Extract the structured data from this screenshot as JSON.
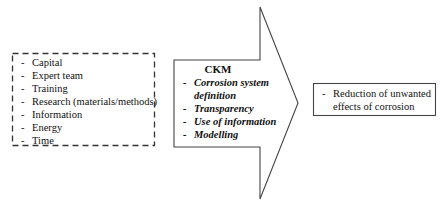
{
  "inputs": {
    "items": [
      "Capital",
      "Expert team",
      "Training",
      "Research (materials/methods)",
      "Information",
      "Energy",
      "Time"
    ]
  },
  "ckm": {
    "title": "CKM",
    "items": [
      {
        "line1": "Corrosion system",
        "line2": "definition"
      },
      {
        "line1": "Transparency",
        "line2": ""
      },
      {
        "line1": "Use of information",
        "line2": ""
      },
      {
        "line1": "Modelling",
        "line2": ""
      }
    ]
  },
  "output": {
    "line1": "Reduction of unwanted",
    "line2": "effects of corrosion"
  },
  "colors": {
    "stroke": "#333333",
    "text": "#111111",
    "background": "#ffffff"
  }
}
